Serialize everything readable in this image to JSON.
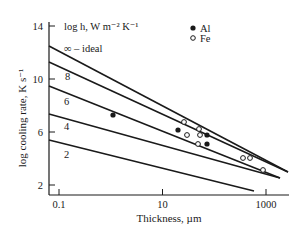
{
  "chart_data": {
    "type": "line",
    "title": "",
    "xlabel": "Thickness, µm",
    "ylabel": "log cooling rate, K s⁻¹",
    "xscale": "log",
    "xlim": [
      0.08,
      3000
    ],
    "ylim": [
      1.4,
      15
    ],
    "x_ticks": [
      {
        "value": 0.1,
        "label": "0.1"
      },
      {
        "value": 10,
        "label": "10"
      },
      {
        "value": 1000,
        "label": "1000"
      }
    ],
    "y_ticks": [
      {
        "value": 2,
        "label": "2"
      },
      {
        "value": 6,
        "label": "6"
      },
      {
        "value": 10,
        "label": "10"
      },
      {
        "value": 14,
        "label": "14"
      }
    ],
    "grid": false,
    "legend_title": "log h, W m⁻² K⁻¹",
    "series": [
      {
        "name": "∞ – ideal",
        "label": "∞ – ideal",
        "x": [
          0.08,
          2500
        ],
        "y": [
          12.5,
          3.1
        ]
      },
      {
        "name": "8",
        "label": "8",
        "x": [
          0.08,
          2500
        ],
        "y": [
          11.3,
          3.1
        ]
      },
      {
        "name": "6",
        "label": "6",
        "x": [
          0.08,
          1800
        ],
        "y": [
          9.4,
          2.6
        ]
      },
      {
        "name": "4",
        "label": "4",
        "x": [
          0.08,
          2000
        ],
        "y": [
          7.4,
          3.3
        ]
      },
      {
        "name": "2",
        "label": "2",
        "x": [
          0.08,
          600
        ],
        "y": [
          5.4,
          1.8
        ]
      }
    ],
    "scatter": [
      {
        "name": "Al",
        "marker": "filled-circle",
        "points": [
          {
            "x": 1.2,
            "y": 7.2
          },
          {
            "x": 20,
            "y": 6.1
          },
          {
            "x": 70,
            "y": 5.9
          },
          {
            "x": 70,
            "y": 5.0
          }
        ]
      },
      {
        "name": "Fe",
        "marker": "open-circle",
        "points": [
          {
            "x": 25,
            "y": 6.8
          },
          {
            "x": 30,
            "y": 5.9
          },
          {
            "x": 50,
            "y": 6.3
          },
          {
            "x": 55,
            "y": 5.9
          },
          {
            "x": 50,
            "y": 5.1
          },
          {
            "x": 400,
            "y": 4.1
          },
          {
            "x": 500,
            "y": 4.2
          },
          {
            "x": 900,
            "y": 3.0
          }
        ]
      }
    ],
    "legend": [
      {
        "name": "Al",
        "marker": "filled-circle"
      },
      {
        "name": "Fe",
        "marker": "open-circle"
      }
    ],
    "legend_position": "top-right"
  }
}
